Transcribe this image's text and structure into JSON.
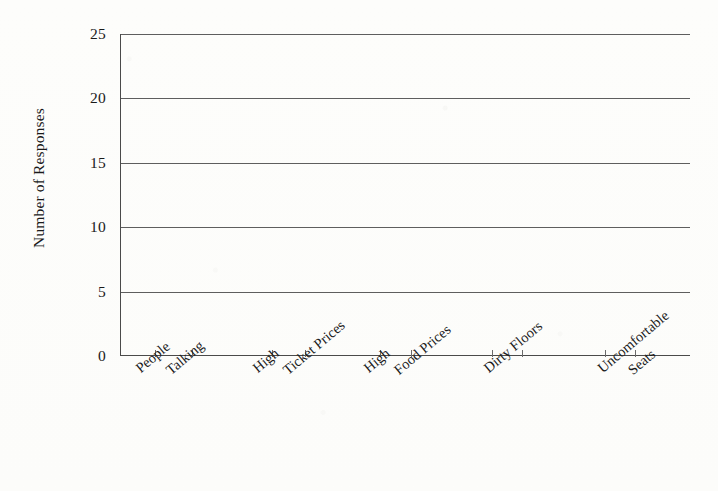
{
  "chart_data": {
    "type": "bar",
    "title": "",
    "xlabel": "",
    "ylabel": "Number of Responses",
    "categories": [
      "People Talking",
      "High Ticket Prices",
      "High Food Prices",
      "Dirty Floors",
      "Uncomfortable Seats"
    ],
    "category_lines": [
      [
        "People",
        "Talking"
      ],
      [
        "High",
        "Ticket Prices"
      ],
      [
        "High",
        "Food Prices"
      ],
      [
        "Dirty Floors",
        ""
      ],
      [
        "Uncomfortable",
        "Seats"
      ]
    ],
    "values": [
      0,
      0,
      0,
      0,
      0
    ],
    "ylim": [
      0,
      25
    ],
    "yticks": [
      0,
      5,
      10,
      15,
      20,
      25
    ],
    "ytick_labels": [
      "0",
      "5",
      "10",
      "15",
      "20",
      "25"
    ],
    "grid": true,
    "grid_axis": "y",
    "legend": "none",
    "note": "Plot area is blank: no bars are drawn for any category."
  },
  "style": {
    "background_color": "#fdfdfb",
    "ink_color": "#1a1a1a",
    "gridline_color": "#5e5e5e",
    "axis_color": "#4a4a4a",
    "bar_color": "#8c8c8c"
  },
  "axis_geometry": {
    "tick_positions_pct": [
      6.1,
      12.6,
      26.7,
      32.5,
      45.6,
      51.0,
      65.3,
      70.5,
      85.1,
      90.4
    ],
    "label_anchors_pct": [
      2.0,
      22.5,
      42.0,
      63.0,
      83.0
    ]
  }
}
